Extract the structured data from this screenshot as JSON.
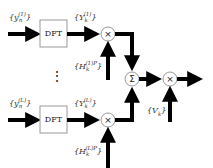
{
  "diagram": {
    "type": "signal-flow block diagram",
    "branches": [
      {
        "input_label": "{y_n^(1)}",
        "input_base": "y",
        "input_sub": "n",
        "input_sup": "(1)",
        "block_label": "DFT",
        "output_label": "{Y_k^(1)}",
        "output_base": "Y",
        "output_sub": "k",
        "output_sup": "(1)",
        "weight_label": "{H_k^(1)P}",
        "weight_base": "H",
        "weight_sub": "k",
        "weight_sup": "(1)P",
        "multiplier_symbol": "×"
      },
      {
        "input_label": "{y_n^(L)}",
        "input_base": "y",
        "input_sub": "n",
        "input_sup": "(L)",
        "block_label": "DFT",
        "output_label": "{Y_k^(L)}",
        "output_base": "Y",
        "output_sub": "k",
        "output_sup": "(L)",
        "weight_label": "{H_k^(L)P}",
        "weight_base": "H",
        "weight_sub": "k",
        "weight_sup": "(L)P",
        "multiplier_symbol": "×"
      }
    ],
    "ellipsis": "⋮",
    "summer_symbol": "Σ",
    "final_multiplier_symbol": "×",
    "final_weight_label": "{V_k}",
    "final_weight_base": "V",
    "final_weight_sub": "k",
    "colors": {
      "arrow": "#000000",
      "block_border": "#999999",
      "node_border": "#999999",
      "text": "#333333"
    }
  }
}
